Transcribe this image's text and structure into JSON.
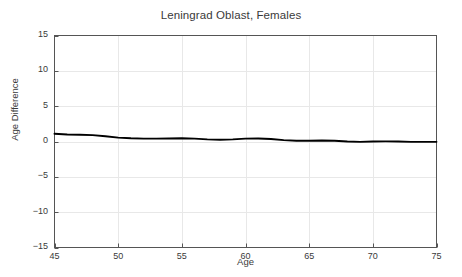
{
  "chart_data": {
    "type": "line",
    "title": "Leningrad Oblast, Females",
    "xlabel": "Age",
    "ylabel": "Age Difference",
    "xlim": [
      45,
      75
    ],
    "ylim": [
      -15,
      15
    ],
    "grid": true,
    "legend": false,
    "xticks": [
      "45",
      "50",
      "55",
      "60",
      "65",
      "70",
      "75"
    ],
    "xtick_values": [
      45,
      50,
      55,
      60,
      65,
      70,
      75
    ],
    "yticks": [
      "15",
      "10",
      "5",
      "0",
      "−5",
      "−10",
      "−15"
    ],
    "ytick_values": [
      15,
      10,
      5,
      0,
      -5,
      -10,
      -15
    ],
    "line_color": "#000000",
    "series": [
      {
        "name": "Age Difference",
        "x": [
          45,
          46,
          47,
          48,
          49,
          50,
          51,
          52,
          53,
          54,
          55,
          56,
          57,
          58,
          59,
          60,
          61,
          62,
          63,
          64,
          65,
          66,
          67,
          68,
          69,
          70,
          71,
          72,
          73,
          74,
          75
        ],
        "values": [
          1.1,
          1.0,
          0.95,
          0.9,
          0.75,
          0.55,
          0.45,
          0.4,
          0.4,
          0.42,
          0.45,
          0.4,
          0.3,
          0.25,
          0.3,
          0.4,
          0.42,
          0.35,
          0.2,
          0.1,
          0.1,
          0.15,
          0.1,
          0.0,
          -0.05,
          0.0,
          0.02,
          0.0,
          -0.05,
          -0.05,
          -0.05
        ]
      }
    ]
  },
  "style": {
    "axis_color": "#555555",
    "grid_color": "#e8e8e8",
    "background": "#ffffff",
    "text_color": "#3a3a3a"
  }
}
